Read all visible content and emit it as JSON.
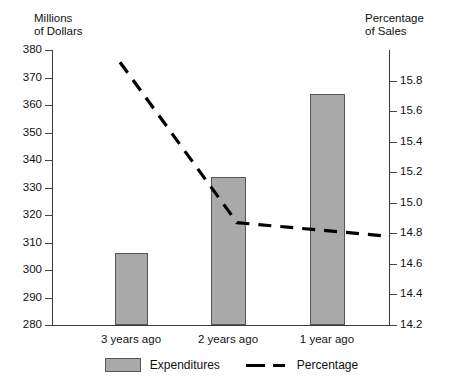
{
  "chart_data": {
    "type": "bar",
    "title": "",
    "categories": [
      "3 years ago",
      "2 years ago",
      "1 year ago"
    ],
    "series": [
      {
        "name": "Expenditures",
        "type": "bar",
        "axis": "left",
        "values": [
          307,
          334,
          364
        ]
      },
      {
        "name": "Percentage",
        "type": "line",
        "style": "dashed",
        "axis": "right",
        "values": [
          15.92,
          14.87,
          14.78
        ]
      }
    ],
    "ylabel": "Millions\nof Dollars",
    "y2label": "Percentage\nof Sales",
    "xlabel": "",
    "ylim": [
      280,
      380
    ],
    "y2lim": [
      14.2,
      16.0
    ],
    "yticks": [
      "380",
      "370",
      "360",
      "350",
      "340",
      "330",
      "320",
      "310",
      "300",
      "290",
      "280"
    ],
    "y2ticks": [
      "15.8",
      "15.6",
      "15.4",
      "15.2",
      "15.0",
      "14.8",
      "14.6",
      "14.4",
      "14.2"
    ],
    "grid": false,
    "legend_position": "bottom",
    "bar_color": "#a9a9a9",
    "line_color": "#000000",
    "axis_color": "#3a3a3a"
  },
  "axes": {
    "left_title": "Millions\nof Dollars",
    "right_title": "Percentage\nof Sales",
    "left_ticks": [
      {
        "label": "380",
        "y": 50
      },
      {
        "label": "370",
        "y": 77.5
      },
      {
        "label": "360",
        "y": 105
      },
      {
        "label": "350",
        "y": 132.5
      },
      {
        "label": "340",
        "y": 160
      },
      {
        "label": "330",
        "y": 187.5
      },
      {
        "label": "320",
        "y": 215
      },
      {
        "label": "310",
        "y": 242.5
      },
      {
        "label": "300",
        "y": 270
      },
      {
        "label": "290",
        "y": 297.5
      },
      {
        "label": "280",
        "y": 325
      }
    ],
    "right_ticks": [
      {
        "label": "15.8",
        "y": 80.6
      },
      {
        "label": "15.6",
        "y": 111.1
      },
      {
        "label": "15.4",
        "y": 141.7
      },
      {
        "label": "15.2",
        "y": 172.2
      },
      {
        "label": "15.0",
        "y": 202.8
      },
      {
        "label": "14.8",
        "y": 233.3
      },
      {
        "label": "14.6",
        "y": 263.9
      },
      {
        "label": "14.4",
        "y": 294.4
      },
      {
        "label": "14.2",
        "y": 325
      }
    ]
  },
  "bars": [
    {
      "label": "3 years ago",
      "value": 307,
      "x": 115,
      "width": 33,
      "top": 253,
      "height": 72
    },
    {
      "label": "2 years ago",
      "value": 334,
      "x": 211,
      "width": 35,
      "top": 177,
      "height": 148
    },
    {
      "label": "1 year ago",
      "value": 364,
      "x": 310,
      "width": 35,
      "top": 94,
      "height": 231
    }
  ],
  "category_labels": [
    {
      "text": "3 years ago",
      "cx": 131
    },
    {
      "text": "2 years ago",
      "cx": 228
    },
    {
      "text": "1 year ago",
      "cx": 327
    }
  ],
  "legend": {
    "items": [
      {
        "name": "Expenditures",
        "kind": "bar"
      },
      {
        "name": "Percentage",
        "kind": "dashed-line"
      }
    ]
  },
  "bleed": {
    "top_text": ""
  }
}
